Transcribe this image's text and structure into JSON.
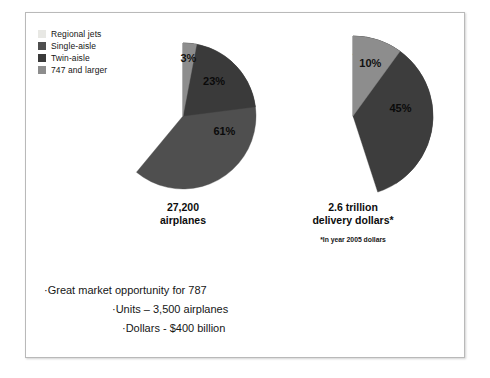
{
  "legend": {
    "items": [
      {
        "label": "Regional jets",
        "color": "#e8e8e4"
      },
      {
        "label": "Single-aisle",
        "color": "#4f4f4f"
      },
      {
        "label": "Twin-aisle",
        "color": "#3a3a3a"
      },
      {
        "label": "747 and larger",
        "color": "#8d8d8d"
      }
    ]
  },
  "chart_data": [
    {
      "type": "pie",
      "title": "27,200\nairplanes",
      "categories": [
        "Regional jets",
        "Single-aisle",
        "Twin-aisle",
        "747 and larger"
      ],
      "values": [
        13,
        61,
        23,
        3
      ],
      "labels": [
        "13%",
        "61%",
        "23%",
        "3%"
      ],
      "colors": [
        "#e8e8e4",
        "#4f4f4f",
        "#3a3a3a",
        "#8d8d8d"
      ],
      "units": "percent",
      "legend_position": "top-left",
      "footnote": ""
    },
    {
      "type": "pie",
      "title": "2.6 trillion\ndelivery dollars*",
      "categories": [
        "Regional jets",
        "Single-aisle",
        "Twin-aisle",
        "747 and larger"
      ],
      "values": [
        4,
        41,
        45,
        10
      ],
      "labels": [
        "4%",
        "41%",
        "45%",
        "10%"
      ],
      "colors": [
        "#e8e8e4",
        "#555555",
        "#3d3d3d",
        "#8d8d8d"
      ],
      "units": "percent",
      "legend_position": "top-left",
      "footnote": "*In year 2005 dollars"
    }
  ],
  "captions": {
    "left": "27,200\nairplanes",
    "right": "2.6 trillion\ndelivery dollars*",
    "right_footnote": "*In year 2005 dollars"
  },
  "bullets": [
    {
      "text": "·Great market opportunity for 787",
      "level": 1
    },
    {
      "text": "·Units – 3,500 airplanes",
      "level": 2
    },
    {
      "text": "·Dollars - $400 billion",
      "level": 3
    }
  ]
}
